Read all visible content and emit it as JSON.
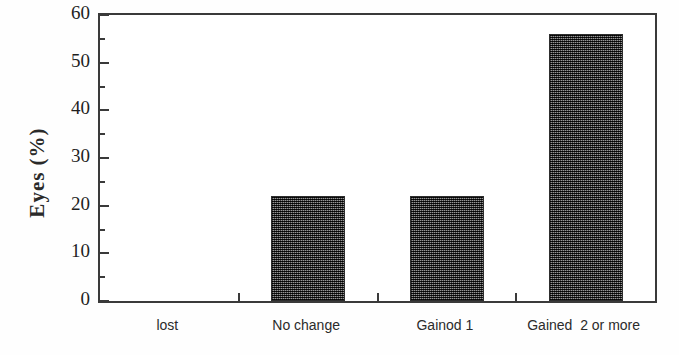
{
  "chart_data": {
    "type": "bar",
    "title": "",
    "xlabel": "",
    "ylabel": "Eyes (%)",
    "categories": [
      "lost",
      "No change",
      "Gainod 1",
      "Gained  2 or more"
    ],
    "values": [
      0,
      22,
      22,
      56
    ],
    "ylim": [
      0,
      60
    ],
    "ytick_labels": [
      "0",
      "10",
      "20",
      "30",
      "40",
      "50",
      "60"
    ],
    "ytick_values": [
      0,
      10,
      20,
      30,
      40,
      50,
      60
    ],
    "yminor_tick_values": [
      5,
      15,
      25,
      35,
      45,
      55
    ],
    "grid": false,
    "legend": false,
    "bar_color": "#4c4c4c",
    "axis_color": "#3a3a3a",
    "background_color": "#ffffff"
  }
}
